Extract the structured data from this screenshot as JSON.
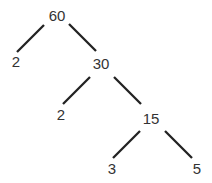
{
  "diagram": {
    "type": "factor-tree",
    "root": "60",
    "nodes": [
      {
        "id": "n60",
        "label": "60",
        "x": 57,
        "y": 21
      },
      {
        "id": "n2a",
        "label": "2",
        "x": 16,
        "y": 67
      },
      {
        "id": "n30",
        "label": "30",
        "x": 101,
        "y": 69
      },
      {
        "id": "n2b",
        "label": "2",
        "x": 61,
        "y": 120
      },
      {
        "id": "n15",
        "label": "15",
        "x": 151,
        "y": 124
      },
      {
        "id": "n3",
        "label": "3",
        "x": 112,
        "y": 174
      },
      {
        "id": "n5",
        "label": "5",
        "x": 197,
        "y": 174
      }
    ],
    "edges": [
      {
        "from": "60",
        "to": "2"
      },
      {
        "from": "60",
        "to": "30"
      },
      {
        "from": "30",
        "to": "2"
      },
      {
        "from": "30",
        "to": "15"
      },
      {
        "from": "15",
        "to": "3"
      },
      {
        "from": "15",
        "to": "5"
      }
    ],
    "leaves": [
      "2",
      "2",
      "3",
      "5"
    ]
  }
}
